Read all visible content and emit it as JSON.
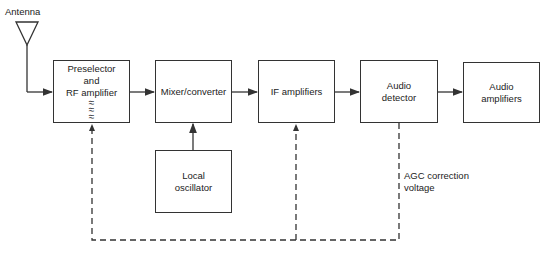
{
  "diagram": {
    "antenna_label": "Antenna",
    "blocks": [
      {
        "id": "preselector",
        "lines": [
          "Preselector",
          "and",
          "RF amplifier"
        ],
        "symbol": "≈"
      },
      {
        "id": "mixer",
        "lines": [
          "Mixer/converter"
        ]
      },
      {
        "id": "if",
        "lines": [
          "IF amplifiers"
        ]
      },
      {
        "id": "detector",
        "lines": [
          "Audio",
          "detector"
        ]
      },
      {
        "id": "audio_amp",
        "lines": [
          "Audio",
          "amplifiers"
        ]
      },
      {
        "id": "local_osc",
        "lines": [
          "Local",
          "oscillator"
        ]
      }
    ],
    "agc_label": [
      "AGC correction",
      "voltage"
    ],
    "colors": {
      "line": "#333333",
      "background": "#ffffff"
    }
  }
}
